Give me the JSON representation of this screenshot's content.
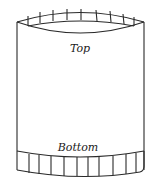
{
  "diagram": {
    "type": "cylinder-with-crimped-ends",
    "labels": {
      "top": "Top",
      "bottom": "Bottom"
    },
    "colors": {
      "line": "#2a2a2a",
      "background": "#ffffff"
    },
    "top_rim_segments": 9,
    "bottom_band_segments": 11
  }
}
